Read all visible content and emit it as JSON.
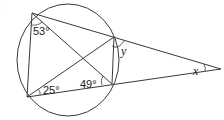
{
  "diagram": {
    "type": "circle-geometry",
    "corner_label": ")",
    "circle": {
      "cx": 68,
      "cy": 60,
      "rx": 51,
      "ry": 56
    },
    "points": {
      "A": {
        "x": 32,
        "y": 13
      },
      "B": {
        "x": 114,
        "y": 37
      },
      "C": {
        "x": 112,
        "y": 84
      },
      "D": {
        "x": 27,
        "y": 97
      },
      "E": {
        "x": 221,
        "y": 69
      }
    },
    "angles": {
      "a53": {
        "text": "53°",
        "x": 35,
        "y": 35
      },
      "a25": {
        "text": "25°",
        "x": 44,
        "y": 95
      },
      "a49": {
        "text": "49°",
        "x": 80,
        "y": 88
      },
      "ay": {
        "text": "y",
        "x": 124,
        "y": 52
      },
      "ax": {
        "text": "x",
        "x": 192,
        "y": 75
      }
    }
  }
}
